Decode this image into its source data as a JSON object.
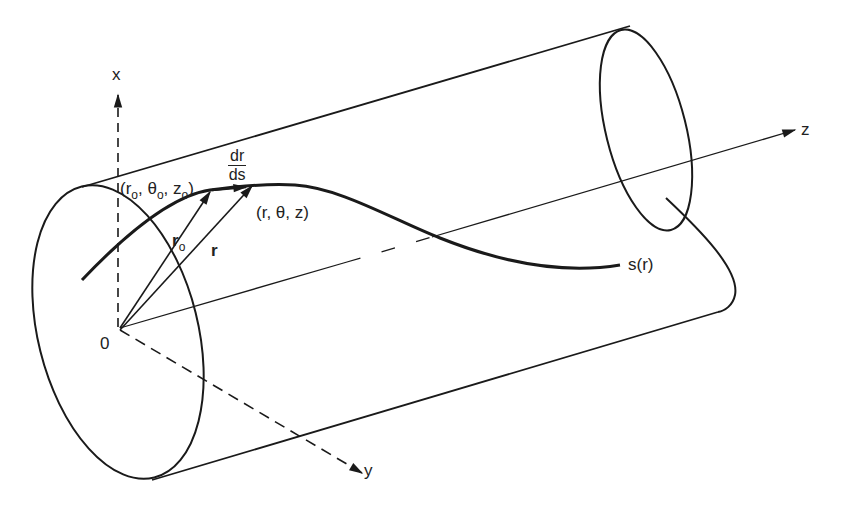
{
  "figure": {
    "stroke_color": "#1a1a1a",
    "background": "#ffffff"
  },
  "labels": {
    "x_axis": "x",
    "y_axis": "y",
    "z_axis": "z",
    "origin": "0",
    "curve": "s(r)",
    "point0": {
      "open": "(r",
      "sub_r": "o",
      "theta": ", θ",
      "sub_theta": "o",
      "z": ", z",
      "sub_z": "o",
      "close": ")"
    },
    "point": "(r, θ, z)",
    "r0_vector": {
      "main": "r",
      "sub": "o"
    },
    "r_vector": "r",
    "tangent": {
      "numerator": "dr",
      "denominator": "ds"
    }
  }
}
